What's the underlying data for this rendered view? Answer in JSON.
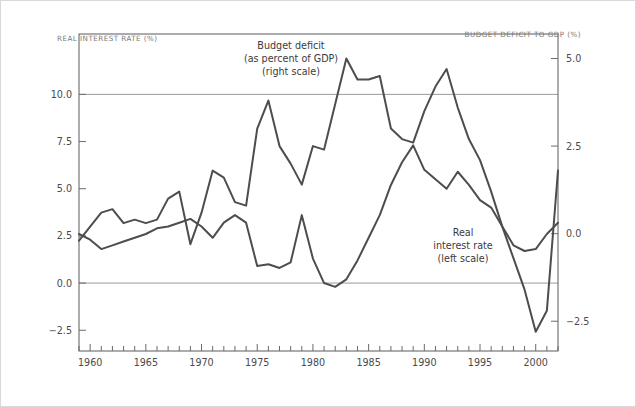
{
  "figure": {
    "left_axis_title": "REAL INTEREST RATE (%)",
    "right_axis_title": "BUDGET DEFICIT TO GDP (%)"
  },
  "annotations": {
    "deficit": {
      "line1": "Budget deficit",
      "line2": "(as percent of GDP)",
      "line3": "(right scale)"
    },
    "real_rate": {
      "line1": "Real",
      "line2": "interest rate",
      "line3": "(left scale)"
    }
  },
  "colors": {
    "line": "#4d4d4d",
    "grid": "#9a9a9a",
    "frame": "#5a5a5a",
    "axis_title": "#7a7a7a",
    "tick_label": "#4a4a4a",
    "background": "#ffffff",
    "outer_border": "#d9d9d9"
  },
  "chart_data": {
    "type": "line",
    "title": "",
    "xlabel": "",
    "grid": true,
    "legend": "annotations-inline",
    "xlim": [
      1959,
      2002
    ],
    "x_major_ticks": [
      1960,
      1965,
      1970,
      1975,
      1980,
      1985,
      1990,
      1995,
      2000
    ],
    "x_major_tick_labels": [
      "1960",
      "1965",
      "1970",
      "1975",
      "1980",
      "1985",
      "1990",
      "1995",
      "2000"
    ],
    "x_minor_tick_step": 1,
    "axes": [
      {
        "id": "left",
        "name": "REAL INTEREST RATE (%)",
        "side": "left",
        "ylim": [
          -3.6,
          13.2
        ],
        "ticks": [
          -2.5,
          0.0,
          2.5,
          5.0,
          7.5,
          10.0
        ],
        "tick_labels": [
          "-2.5",
          "0.0",
          "2.5",
          "5.0",
          "7.5",
          "10.0"
        ]
      },
      {
        "id": "right",
        "name": "BUDGET DEFICIT TO GDP (%)",
        "side": "right",
        "ylim": [
          -3.35,
          5.7
        ],
        "ticks": [
          -2.5,
          0.0,
          2.5,
          5.0
        ],
        "tick_labels": [
          "-2.5",
          "0.0",
          "2.5",
          "5.0"
        ]
      }
    ],
    "gridline_values": [
      {
        "axis": "left",
        "value": 10.0,
        "right_equivalent": 0.0
      },
      {
        "axis": "left",
        "value": 0.0,
        "right_equivalent": -2.9
      }
    ],
    "x": [
      1959,
      1960,
      1961,
      1962,
      1963,
      1964,
      1965,
      1966,
      1967,
      1968,
      1969,
      1970,
      1971,
      1972,
      1973,
      1974,
      1975,
      1976,
      1977,
      1978,
      1979,
      1980,
      1981,
      1982,
      1983,
      1984,
      1985,
      1986,
      1987,
      1988,
      1989,
      1990,
      1991,
      1992,
      1993,
      1994,
      1995,
      1996,
      1997,
      1998,
      1999,
      2000,
      2001,
      2002
    ],
    "series": [
      {
        "name": "Budget deficit (as percent of GDP)",
        "axis": "right",
        "label_line1": "Budget deficit",
        "label_line2": "(as percent of GDP)",
        "label_line3": "(right scale)",
        "values": [
          -0.2,
          0.2,
          0.6,
          0.7,
          0.3,
          0.4,
          0.3,
          0.4,
          1.0,
          1.2,
          -0.3,
          0.6,
          1.8,
          1.6,
          0.9,
          0.8,
          3.0,
          3.8,
          2.5,
          2.0,
          1.4,
          2.5,
          2.4,
          3.7,
          5.0,
          4.4,
          4.4,
          4.5,
          3.0,
          2.7,
          2.6,
          3.5,
          4.2,
          4.7,
          3.6,
          2.7,
          2.1,
          1.2,
          0.2,
          -0.7,
          -1.6,
          -2.8,
          -2.2,
          1.8
        ]
      },
      {
        "name": "Real interest rate",
        "axis": "left",
        "label_line1": "Real",
        "label_line2": "interest rate",
        "label_line3": "(left scale)",
        "values": [
          2.6,
          2.3,
          1.8,
          2.0,
          2.2,
          2.4,
          2.6,
          2.9,
          3.0,
          3.2,
          3.4,
          3.0,
          2.4,
          3.2,
          3.6,
          3.2,
          0.9,
          1.0,
          0.8,
          1.1,
          3.6,
          1.3,
          0.0,
          -0.2,
          0.2,
          1.2,
          2.4,
          3.6,
          5.2,
          6.4,
          7.3,
          6.0,
          5.5,
          5.0,
          5.9,
          5.2,
          4.4,
          4.0,
          3.0,
          2.0,
          1.7,
          1.8,
          2.6,
          3.2
        ]
      }
    ]
  }
}
